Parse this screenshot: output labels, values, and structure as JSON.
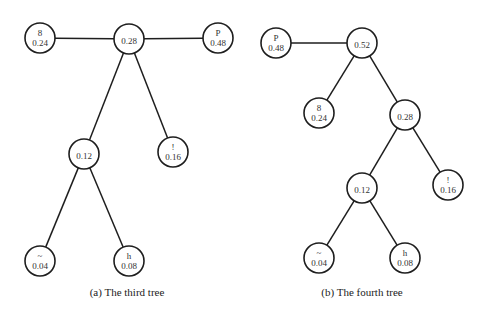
{
  "figure": {
    "node_radius": 15,
    "trees": [
      {
        "id": "a",
        "caption": "(a)  The third tree",
        "caption_pos": [
          127,
          296
        ],
        "nodes": [
          {
            "id": "a-root",
            "symbol": "",
            "weight": "0.28",
            "x": 129,
            "y": 39
          },
          {
            "id": "a-8",
            "symbol": "8",
            "weight": "0.24",
            "x": 40,
            "y": 38
          },
          {
            "id": "a-P",
            "symbol": "P",
            "weight": "0.48",
            "x": 218,
            "y": 38
          },
          {
            "id": "a-012",
            "symbol": "",
            "weight": "0.12",
            "x": 84,
            "y": 154
          },
          {
            "id": "a-excl",
            "symbol": "!",
            "weight": "0.16",
            "x": 173,
            "y": 152
          },
          {
            "id": "a-tilde",
            "symbol": "~",
            "weight": "0.04",
            "x": 40,
            "y": 261
          },
          {
            "id": "a-h",
            "symbol": "h",
            "weight": "0.08",
            "x": 129,
            "y": 261
          }
        ],
        "edges": [
          [
            "a-root",
            "a-8"
          ],
          [
            "a-root",
            "a-P"
          ],
          [
            "a-root",
            "a-012"
          ],
          [
            "a-root",
            "a-excl"
          ],
          [
            "a-012",
            "a-tilde"
          ],
          [
            "a-012",
            "a-h"
          ]
        ]
      },
      {
        "id": "b",
        "caption": "(b)  The fourth tree",
        "caption_pos": [
          362,
          296
        ],
        "nodes": [
          {
            "id": "b-root",
            "symbol": "",
            "weight": "0.52",
            "x": 362,
            "y": 43
          },
          {
            "id": "b-P",
            "symbol": "P",
            "weight": "0.48",
            "x": 276,
            "y": 43
          },
          {
            "id": "b-8",
            "symbol": "8",
            "weight": "0.24",
            "x": 319,
            "y": 113
          },
          {
            "id": "b-028",
            "symbol": "",
            "weight": "0.28",
            "x": 405,
            "y": 115
          },
          {
            "id": "b-012",
            "symbol": "",
            "weight": "0.12",
            "x": 362,
            "y": 188
          },
          {
            "id": "b-excl",
            "symbol": "!",
            "weight": "0.16",
            "x": 448,
            "y": 185
          },
          {
            "id": "b-tilde",
            "symbol": "~",
            "weight": "0.04",
            "x": 319,
            "y": 258
          },
          {
            "id": "b-h",
            "symbol": "h",
            "weight": "0.08",
            "x": 405,
            "y": 258
          }
        ],
        "edges": [
          [
            "b-root",
            "b-P"
          ],
          [
            "b-root",
            "b-8"
          ],
          [
            "b-root",
            "b-028"
          ],
          [
            "b-028",
            "b-012"
          ],
          [
            "b-028",
            "b-excl"
          ],
          [
            "b-012",
            "b-tilde"
          ],
          [
            "b-012",
            "b-h"
          ]
        ]
      }
    ]
  }
}
